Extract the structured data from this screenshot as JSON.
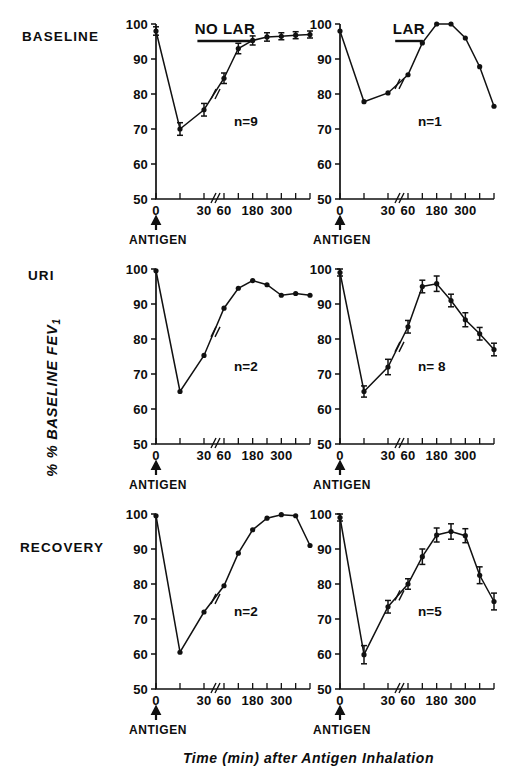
{
  "figure": {
    "y_axis_title_main": "% BASELINE FEV",
    "y_axis_title_sub": "1",
    "x_axis_title": "Time (min) after Antigen Inhalation",
    "antigen_label": "ANTIGEN",
    "row_labels": {
      "baseline": "BASELINE",
      "uri": "URI",
      "recovery": "RECOVERY"
    },
    "column_headers": {
      "left": "NO LAR",
      "right": "LAR"
    },
    "ytick_labels": [
      "50",
      "60",
      "70",
      "80",
      "90",
      "100"
    ],
    "xtick_labels_major": [
      "0",
      "30",
      "60",
      "180",
      "300"
    ]
  },
  "chart_data": [
    {
      "id": "baseline-no-lar",
      "type": "line",
      "title": "NO LAR",
      "row": "BASELINE",
      "n_label": "n=9",
      "n": 9,
      "xlabel": "Time (min) after Antigen Inhalation",
      "ylabel": "% BASELINE FEV1",
      "ylim": [
        50,
        100
      ],
      "yticks": [
        50,
        60,
        70,
        80,
        90,
        100
      ],
      "xticks": [
        0,
        15,
        30,
        60,
        120,
        180,
        240,
        300,
        360,
        420
      ],
      "xtick_labels": [
        "0",
        "",
        "30",
        "60",
        "",
        "180",
        "",
        "300",
        "",
        ""
      ],
      "axis_break_between": [
        30,
        60
      ],
      "grid": false,
      "x": [
        0,
        15,
        30,
        60,
        120,
        180,
        240,
        300,
        360,
        420
      ],
      "values": [
        98,
        70,
        75.5,
        84.5,
        93,
        95.3,
        96.3,
        96.5,
        96.8,
        97
      ],
      "errors": [
        1.2,
        1.8,
        1.8,
        1.5,
        1.5,
        1.3,
        1.2,
        1.0,
        1.0,
        1.0
      ]
    },
    {
      "id": "baseline-lar",
      "type": "line",
      "title": "LAR",
      "row": "BASELINE",
      "n_label": "n=1",
      "n": 1,
      "xlabel": "Time (min) after Antigen Inhalation",
      "ylabel": "% BASELINE FEV1",
      "ylim": [
        50,
        100
      ],
      "yticks": [
        50,
        60,
        70,
        80,
        90,
        100
      ],
      "xticks": [
        0,
        15,
        30,
        60,
        120,
        180,
        240,
        300,
        360,
        420
      ],
      "xtick_labels": [
        "0",
        "",
        "30",
        "60",
        "",
        "180",
        "",
        "300",
        "",
        ""
      ],
      "axis_break_between": [
        30,
        60
      ],
      "grid": false,
      "x": [
        0,
        15,
        30,
        60,
        120,
        180,
        240,
        300,
        360,
        420
      ],
      "values": [
        98,
        77.8,
        80.3,
        85.5,
        94.6,
        100,
        100,
        96,
        87.8,
        76.5
      ],
      "errors": [
        0,
        0,
        0,
        0,
        0,
        0,
        0,
        0,
        0,
        0
      ]
    },
    {
      "id": "uri-no-lar",
      "type": "line",
      "title": "NO LAR",
      "row": "URI",
      "n_label": "n=2",
      "n": 2,
      "xlabel": "Time (min) after Antigen Inhalation",
      "ylabel": "% BASELINE FEV1",
      "ylim": [
        50,
        100
      ],
      "yticks": [
        50,
        60,
        70,
        80,
        90,
        100
      ],
      "xticks": [
        0,
        15,
        30,
        60,
        120,
        180,
        240,
        300,
        360,
        420
      ],
      "xtick_labels": [
        "0",
        "",
        "30",
        "60",
        "",
        "180",
        "",
        "300",
        "",
        ""
      ],
      "axis_break_between": [
        30,
        60
      ],
      "grid": false,
      "x": [
        0,
        15,
        30,
        60,
        120,
        180,
        240,
        300,
        360,
        420
      ],
      "values": [
        99.5,
        65,
        75.3,
        88.8,
        94.5,
        96.7,
        95.5,
        92.5,
        93,
        92.5
      ],
      "errors": [
        0,
        0,
        0,
        0,
        0,
        0,
        0,
        0,
        0,
        0
      ]
    },
    {
      "id": "uri-lar",
      "type": "line",
      "title": "LAR",
      "row": "URI",
      "n_label": "n= 8",
      "n": 8,
      "xlabel": "Time (min) after Antigen Inhalation",
      "ylabel": "% BASELINE FEV1",
      "ylim": [
        50,
        100
      ],
      "yticks": [
        50,
        60,
        70,
        80,
        90,
        100
      ],
      "xticks": [
        0,
        15,
        30,
        60,
        120,
        180,
        240,
        300,
        360,
        420
      ],
      "xtick_labels": [
        "0",
        "",
        "30",
        "60",
        "",
        "180",
        "",
        "300",
        "",
        ""
      ],
      "axis_break_between": [
        30,
        60
      ],
      "grid": false,
      "x": [
        0,
        15,
        30,
        60,
        120,
        180,
        240,
        300,
        360,
        420
      ],
      "values": [
        99,
        65,
        72,
        83.5,
        95,
        95.8,
        91,
        85.5,
        81.5,
        77
      ],
      "errors": [
        1.0,
        1.6,
        2.2,
        1.8,
        1.8,
        2.2,
        1.8,
        2.0,
        1.8,
        1.8
      ]
    },
    {
      "id": "recovery-no-lar",
      "type": "line",
      "title": "NO LAR",
      "row": "RECOVERY",
      "n_label": "n=2",
      "n": 2,
      "xlabel": "Time (min) after Antigen Inhalation",
      "ylabel": "% BASELINE FEV1",
      "ylim": [
        50,
        100
      ],
      "yticks": [
        50,
        60,
        70,
        80,
        90,
        100
      ],
      "xticks": [
        0,
        15,
        30,
        60,
        120,
        180,
        240,
        300,
        360,
        420
      ],
      "xtick_labels": [
        "0",
        "",
        "30",
        "60",
        "",
        "180",
        "",
        "300",
        "",
        ""
      ],
      "axis_break_between": [
        30,
        60
      ],
      "grid": false,
      "x": [
        0,
        15,
        30,
        60,
        120,
        180,
        240,
        300,
        360,
        420
      ],
      "values": [
        99.5,
        60.5,
        72,
        79.5,
        88.8,
        95.5,
        98.8,
        99.8,
        99.5,
        91
      ],
      "errors": [
        0,
        0,
        0,
        0,
        0,
        0,
        0,
        0,
        0,
        0
      ]
    },
    {
      "id": "recovery-lar",
      "type": "line",
      "title": "LAR",
      "row": "RECOVERY",
      "n_label": "n=5",
      "n": 5,
      "xlabel": "Time (min) after Antigen Inhalation",
      "ylabel": "% BASELINE FEV1",
      "ylim": [
        50,
        100
      ],
      "yticks": [
        50,
        60,
        70,
        80,
        90,
        100
      ],
      "xticks": [
        0,
        15,
        30,
        60,
        120,
        180,
        240,
        300,
        360,
        420
      ],
      "xtick_labels": [
        "0",
        "",
        "30",
        "60",
        "",
        "180",
        "",
        "300",
        "",
        ""
      ],
      "axis_break_between": [
        30,
        60
      ],
      "grid": false,
      "x": [
        0,
        15,
        30,
        60,
        120,
        180,
        240,
        300,
        360,
        420
      ],
      "values": [
        99,
        59.8,
        73.5,
        80,
        87.8,
        94,
        95,
        93.8,
        82.5,
        75
      ],
      "errors": [
        1.0,
        2.6,
        1.8,
        1.5,
        2.2,
        2.0,
        2.2,
        2.0,
        2.4,
        2.4
      ]
    }
  ]
}
